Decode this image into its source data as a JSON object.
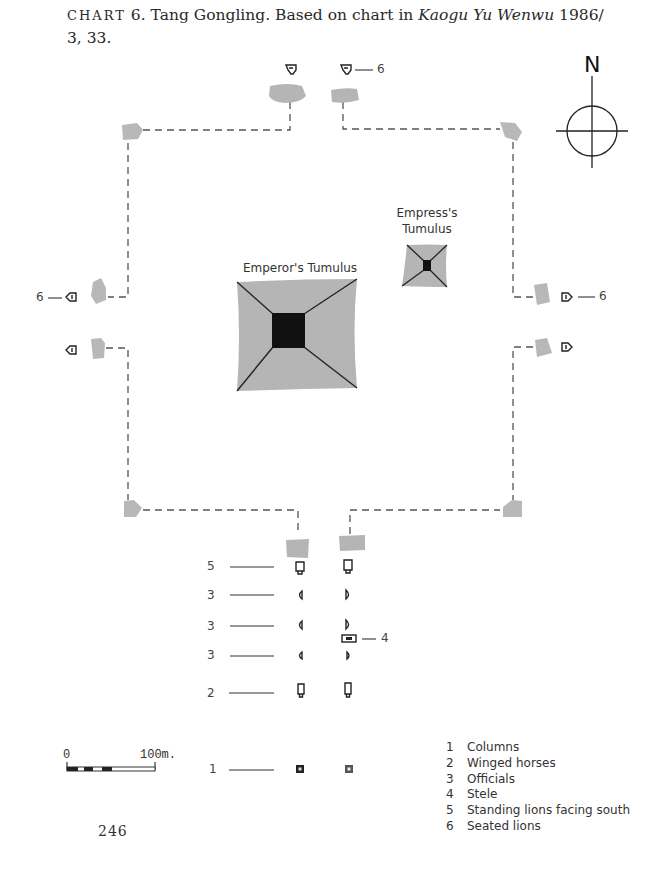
{
  "caption": {
    "prefix": "CHART",
    "number": "6",
    "text_before_italic": ". Tang Gongling. Based on chart in ",
    "italic": "Kaogu Yu Wenwu",
    "text_after_italic": " 1986/",
    "line2": "3, 33."
  },
  "compass": {
    "label": "N"
  },
  "tumuli": {
    "emperor": "Emperor's Tumulus",
    "empress_line1": "Empress's",
    "empress_line2": "Tumulus"
  },
  "callouts": {
    "north_gate_lion": "6",
    "west_gate_lion": "6",
    "east_gate_lion": "6",
    "stele": "4"
  },
  "avenue_rows": [
    {
      "key": "5",
      "feature": "standing-lion"
    },
    {
      "key": "3",
      "feature": "official"
    },
    {
      "key": "3",
      "feature": "official"
    },
    {
      "key": "3",
      "feature": "official"
    },
    {
      "key": "2",
      "feature": "winged-horse"
    },
    {
      "key": "1",
      "feature": "column"
    }
  ],
  "scale_bar": {
    "start": "0",
    "end": "100m."
  },
  "legend": [
    {
      "key": "1",
      "label": "Columns"
    },
    {
      "key": "2",
      "label": "Winged horses"
    },
    {
      "key": "3",
      "label": "Officials"
    },
    {
      "key": "4",
      "label": "Stele"
    },
    {
      "key": "5",
      "label": "Standing lions facing south"
    },
    {
      "key": "6",
      "label": "Seated lions"
    }
  ],
  "page_number": "246",
  "colors": {
    "mound_gray": "#b5b5b5",
    "tower_gray": "#b8b8b8",
    "chamber_black": "#111111",
    "line_dark": "#333333"
  }
}
